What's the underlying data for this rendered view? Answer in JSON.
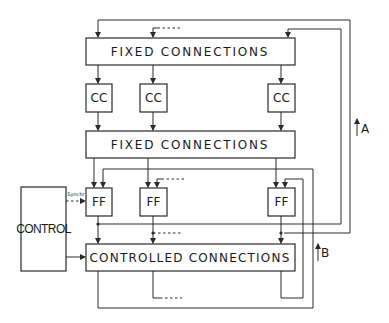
{
  "diagram": {
    "fixed_connections_top": {
      "label": "FIXED CONNECTIONS"
    },
    "cc_boxes": [
      {
        "label": "CC"
      },
      {
        "label": "CC"
      },
      {
        "label": "CC"
      }
    ],
    "fixed_connections_bottom": {
      "label": "FIXED CONNECTIONS"
    },
    "ff_boxes": [
      {
        "label": "FF"
      },
      {
        "label": "FF"
      },
      {
        "label": "FF"
      }
    ],
    "control": {
      "label": "CONTROL",
      "synchr_label": "Synchr"
    },
    "controlled_connections": {
      "label": "CONTROLLED CONNECTIONS"
    },
    "feedback_labels": {
      "a": "A",
      "b": "B"
    },
    "colors": {
      "line": "#2a2a2a",
      "background": "#ffffff"
    }
  }
}
